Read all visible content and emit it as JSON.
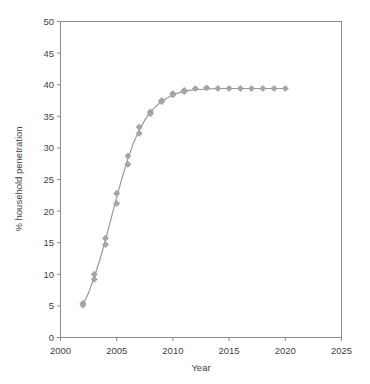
{
  "figure": {
    "background_color": "#ffffff",
    "frame_color": "#8c8c8c",
    "series_color": "#a6a6a6",
    "curve_color": "#9a9a9a"
  },
  "chart_data": {
    "type": "scatter",
    "title": "",
    "subtitle": "",
    "xlabel": "Year",
    "ylabel": "% household penetration",
    "xlim": [
      2000,
      2025
    ],
    "ylim": [
      0,
      50
    ],
    "xticks": [
      2000,
      2005,
      2010,
      2015,
      2020,
      2025
    ],
    "xtick_labels": [
      "2000",
      "2005",
      "2010",
      "2015",
      "2020",
      "2025"
    ],
    "yticks": [
      0,
      5,
      10,
      15,
      20,
      25,
      30,
      35,
      40,
      45,
      50
    ],
    "ytick_labels": [
      "0",
      "5",
      "10",
      "15",
      "20",
      "25",
      "30",
      "35",
      "40",
      "45",
      "50"
    ],
    "grid": false,
    "legend": null,
    "legend_position": "none",
    "marker": "diamond",
    "annotations": [],
    "series": [
      {
        "name": "Observed % household penetration",
        "marker": "diamond",
        "x": [
          2002,
          2002,
          2003,
          2003,
          2004,
          2004,
          2005,
          2005,
          2006,
          2006,
          2007,
          2007,
          2008,
          2008,
          2009,
          2009,
          2010,
          2010,
          2011,
          2011,
          2012,
          2013,
          2014,
          2015,
          2016,
          2017,
          2018,
          2019,
          2020
        ],
        "values": [
          5.4,
          5.1,
          10.0,
          9.2,
          15.7,
          14.7,
          22.8,
          21.2,
          28.7,
          27.4,
          33.3,
          32.3,
          35.7,
          35.4,
          37.5,
          37.3,
          38.6,
          38.4,
          39.1,
          38.9,
          39.4,
          39.5,
          39.4,
          39.4,
          39.4,
          39.4,
          39.4,
          39.4,
          39.4
        ]
      },
      {
        "name": "Fitted logistic curve",
        "marker": "none",
        "line": true,
        "x": [
          2002.0,
          2002.5,
          2003.0,
          2003.5,
          2004.0,
          2004.5,
          2005.0,
          2005.5,
          2006.0,
          2006.5,
          2007.0,
          2007.5,
          2008.0,
          2008.5,
          2009.0,
          2009.5,
          2010.0,
          2010.5,
          2011.0,
          2011.5,
          2012.0,
          2013.0,
          2014.0,
          2015.0,
          2016.0,
          2017.0,
          2018.0,
          2019.0,
          2020.0
        ],
        "values": [
          5.2,
          7.1,
          9.5,
          12.3,
          15.4,
          18.8,
          22.2,
          25.4,
          28.3,
          30.8,
          32.8,
          34.4,
          35.7,
          36.6,
          37.4,
          37.9,
          38.4,
          38.7,
          38.9,
          39.1,
          39.2,
          39.3,
          39.4,
          39.4,
          39.4,
          39.4,
          39.4,
          39.4,
          39.4
        ]
      }
    ]
  }
}
